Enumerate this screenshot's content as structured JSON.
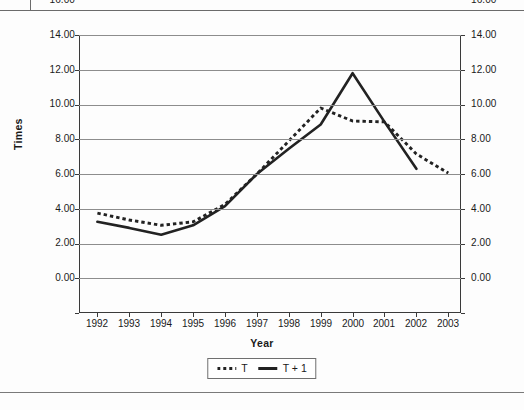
{
  "page": {
    "background_color": "#fdfdfd",
    "rule_color": "#6b6b6b"
  },
  "chart_data": {
    "type": "line",
    "title": "",
    "xlabel": "Year",
    "ylabel": "Times",
    "categories": [
      "1992",
      "1993",
      "1994",
      "1995",
      "1996",
      "1997",
      "1998",
      "1999",
      "2000",
      "2001",
      "2002",
      "2003"
    ],
    "x": [
      1992,
      1993,
      1994,
      1995,
      1996,
      1997,
      1998,
      1999,
      2000,
      2001,
      2002,
      2003
    ],
    "ylim": [
      0,
      16
    ],
    "ytick_labels": [
      "16.00",
      "14.00",
      "12.00",
      "10.00",
      "8.00",
      "6.00",
      "4.00",
      "2.00",
      "0.00"
    ],
    "ytick_values": [
      16,
      14,
      12,
      10,
      8,
      6,
      4,
      2,
      0
    ],
    "y_axis_both_sides": true,
    "grid": true,
    "legend_position": "bottom-center",
    "series": [
      {
        "name": "T",
        "style": "dotted",
        "color": "#222222",
        "values": [
          5.75,
          5.35,
          5.05,
          5.25,
          6.25,
          8.0,
          9.9,
          11.8,
          11.05,
          11.0,
          9.15,
          8.05
        ]
      },
      {
        "name": "T + 1",
        "style": "solid",
        "color": "#222222",
        "values": [
          5.25,
          4.9,
          4.5,
          5.05,
          6.15,
          8.0,
          9.45,
          10.85,
          13.8,
          11.0,
          8.3,
          null
        ]
      }
    ]
  },
  "legend": {
    "entries": [
      {
        "label": "T",
        "marker": "dotted-line-swatch"
      },
      {
        "label": "T + 1",
        "marker": "solid-line-swatch"
      }
    ]
  }
}
